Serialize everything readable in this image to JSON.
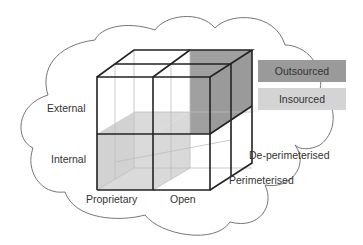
{
  "diagram": {
    "labels": {
      "external": "External",
      "internal": "Internal",
      "proprietary": "Proprietary",
      "open": "Open",
      "perimeterised": "Perimeterised",
      "de_perimeterised": "De-perimeterised"
    },
    "legend": [
      {
        "label": "Outsourced",
        "color": "#9a9a9a"
      },
      {
        "label": "Insourced",
        "color": "#d4d4d4"
      }
    ],
    "colors": {
      "outsourced": "#9a9a9a",
      "insourced": "#d4d4d4",
      "cube_edge": "#222222",
      "inner_edge": "#bbbbbb",
      "cloud_line": "#555555"
    }
  }
}
